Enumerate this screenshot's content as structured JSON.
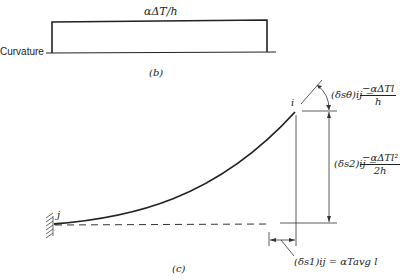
{
  "figure_b": {
    "top_label": "αΔT/h",
    "axis_label": "Curvature",
    "caption": "(b)"
  },
  "figure_c": {
    "caption": "(c)",
    "node_i": "i",
    "node_j": "j",
    "rotation": {
      "lhs": "(δsθ)ij =",
      "numerator": "−αΔTl",
      "denominator": "h"
    },
    "vertical_deflection": {
      "lhs": "(δs2)ij =",
      "numerator": "−αΔTl²",
      "denominator": "2h"
    },
    "axial": {
      "text": "(δs1)ij = αTavg l"
    }
  }
}
